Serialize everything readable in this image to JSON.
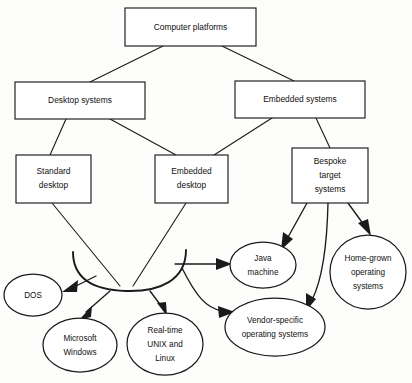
{
  "diagram": {
    "title": "Computer platforms",
    "type": "hierarchy-tree",
    "stroke_color": "#1a1a1a",
    "fill_color": "#ffffff",
    "background_color": "#fdfdfc",
    "nodes": [
      {
        "id": "computer-platforms",
        "shape": "box",
        "label": "Computer platforms",
        "lines": [
          "Computer platforms"
        ],
        "level": 0
      },
      {
        "id": "desktop-systems",
        "shape": "box",
        "label": "Desktop systems",
        "lines": [
          "Desktop systems"
        ],
        "level": 1
      },
      {
        "id": "embedded-systems",
        "shape": "box",
        "label": "Embedded systems",
        "lines": [
          "Embedded systems"
        ],
        "level": 1
      },
      {
        "id": "standard-desktop",
        "shape": "box",
        "label": "Standard desktop",
        "lines": [
          "Standard",
          "desktop"
        ],
        "level": 2
      },
      {
        "id": "embedded-desktop",
        "shape": "box",
        "label": "Embedded desktop",
        "lines": [
          "Embedded",
          "desktop"
        ],
        "level": 2
      },
      {
        "id": "bespoke-target-systems",
        "shape": "box",
        "label": "Bespoke target systems",
        "lines": [
          "Bespoke",
          "target",
          "systems"
        ],
        "level": 2
      },
      {
        "id": "dos",
        "shape": "ellipse",
        "label": "DOS",
        "lines": [
          "DOS"
        ],
        "level": 3
      },
      {
        "id": "microsoft-windows",
        "shape": "ellipse",
        "label": "Microsoft Windows",
        "lines": [
          "Microsoft",
          "Windows"
        ],
        "level": 3
      },
      {
        "id": "real-time-unix-and-linux",
        "shape": "ellipse",
        "label": "Real-time UNIX and Linux",
        "lines": [
          "Real-time",
          "UNIX and",
          "Linux"
        ],
        "level": 3
      },
      {
        "id": "java-machine",
        "shape": "ellipse",
        "label": "Java machine",
        "lines": [
          "Java",
          "machine"
        ],
        "level": 3
      },
      {
        "id": "vendor-specific-operating-systems",
        "shape": "ellipse",
        "label": "Vendor-specific operating systems",
        "lines": [
          "Vendor-specific",
          "operating systems"
        ],
        "level": 3
      },
      {
        "id": "home-grown-operating-systems",
        "shape": "ellipse",
        "label": "Home-grown operating systems",
        "lines": [
          "Home-grown",
          "operating",
          "systems"
        ],
        "level": 3
      }
    ],
    "edges": [
      {
        "from": "computer-platforms",
        "to": "desktop-systems",
        "arrow": false
      },
      {
        "from": "computer-platforms",
        "to": "embedded-systems",
        "arrow": false
      },
      {
        "from": "desktop-systems",
        "to": "standard-desktop",
        "arrow": false
      },
      {
        "from": "desktop-systems",
        "to": "embedded-desktop",
        "arrow": false
      },
      {
        "from": "embedded-systems",
        "to": "embedded-desktop",
        "arrow": false
      },
      {
        "from": "embedded-systems",
        "to": "bespoke-target-systems",
        "arrow": false
      },
      {
        "from": "standard-desktop",
        "to": "collector-arc",
        "arrow": false
      },
      {
        "from": "embedded-desktop",
        "to": "collector-arc",
        "arrow": false
      },
      {
        "from": "collector-arc",
        "to": "dos",
        "arrow": true
      },
      {
        "from": "collector-arc",
        "to": "microsoft-windows",
        "arrow": true
      },
      {
        "from": "collector-arc",
        "to": "real-time-unix-and-linux",
        "arrow": true
      },
      {
        "from": "collector-arc",
        "to": "java-machine",
        "arrow": true
      },
      {
        "from": "collector-arc",
        "to": "vendor-specific-operating-systems",
        "arrow": true
      },
      {
        "from": "bespoke-target-systems",
        "to": "java-machine",
        "arrow": true
      },
      {
        "from": "bespoke-target-systems",
        "to": "vendor-specific-operating-systems",
        "arrow": true
      },
      {
        "from": "bespoke-target-systems",
        "to": "home-grown-operating-systems",
        "arrow": true
      }
    ]
  }
}
